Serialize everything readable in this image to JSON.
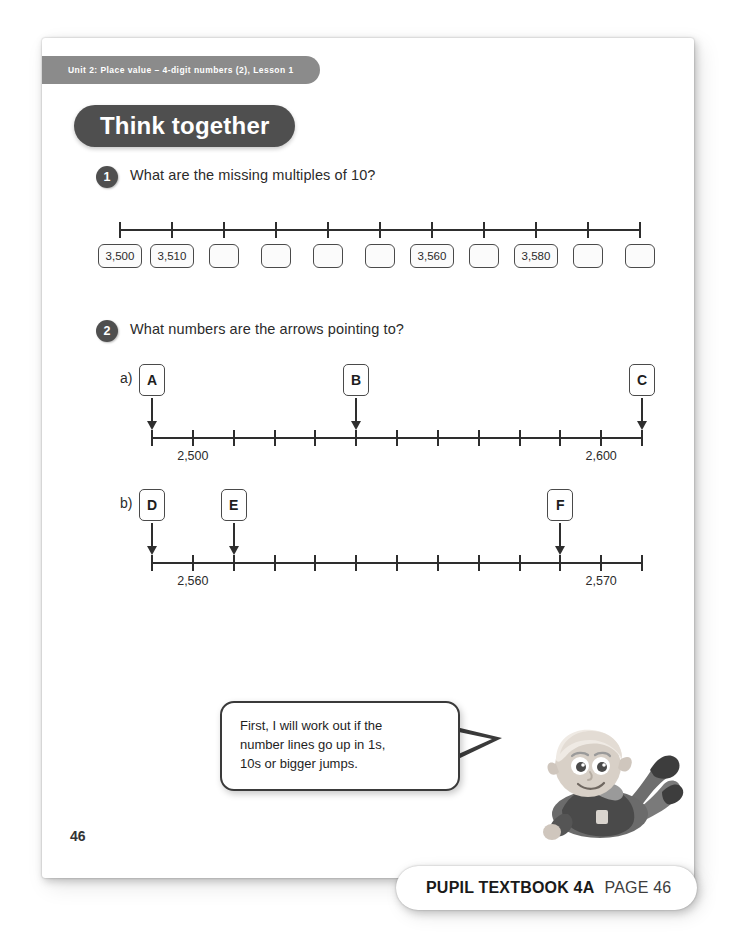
{
  "page": {
    "unit_banner": "Unit 2: Place value – 4-digit numbers (2), Lesson 1",
    "section_title": "Think together",
    "page_number": "46"
  },
  "footer": {
    "book_label": "PUPIL TEXTBOOK 4A",
    "page_label": "PAGE 46"
  },
  "questions": [
    {
      "number": "1",
      "text": "What are the missing multiples of 10?"
    },
    {
      "number": "2",
      "text": "What numbers are the arrows pointing to?",
      "part_a_label": "a)",
      "part_b_label": "b)"
    }
  ],
  "speech_bubble": {
    "line1": "First, I will work out if the",
    "line2": "number lines go up in 1s,",
    "line3": "10s or bigger jumps."
  },
  "chart_data": [
    {
      "type": "line",
      "name": "q1-number-line",
      "title": "What are the missing multiples of 10?",
      "tick_count": 11,
      "boxes": [
        "3,500",
        "3,510",
        "",
        "",
        "",
        "",
        "3,560",
        "",
        "3,580",
        "",
        ""
      ],
      "step": 10,
      "grid": false
    },
    {
      "type": "line",
      "name": "q2a-number-line",
      "title": "a) What numbers are the arrows pointing to?",
      "tick_count": 13,
      "tick_labels": [
        {
          "index": 1,
          "text": "2,500"
        },
        {
          "index": 11,
          "text": "2,600"
        }
      ],
      "arrows": [
        {
          "label": "A",
          "index": 0
        },
        {
          "label": "B",
          "index": 5
        },
        {
          "label": "C",
          "index": 12
        }
      ],
      "grid": false
    },
    {
      "type": "line",
      "name": "q2b-number-line",
      "title": "b) What numbers are the arrows pointing to?",
      "tick_count": 13,
      "tick_labels": [
        {
          "index": 1,
          "text": "2,560"
        },
        {
          "index": 11,
          "text": "2,570"
        }
      ],
      "arrows": [
        {
          "label": "D",
          "index": 0
        },
        {
          "label": "E",
          "index": 2
        },
        {
          "label": "F",
          "index": 10
        }
      ],
      "grid": false
    }
  ],
  "colors": {
    "banner_dark": "#4f4f4f",
    "banner_gray": "#8b8b8b",
    "ink": "#2e2e2e"
  }
}
